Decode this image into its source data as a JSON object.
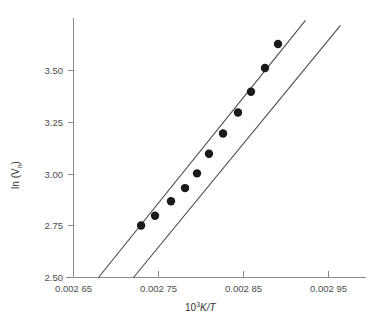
{
  "chart_data": {
    "type": "scatter",
    "title": "",
    "xlabel": "10³K/T",
    "ylabel": "ln (Vₙ)",
    "xlabel_parts": {
      "base": "10",
      "exponent": "3",
      "rest": "K/T"
    },
    "ylabel_parts": {
      "base": "ln (V",
      "subscript": "n",
      "close": ")"
    },
    "xlim": [
      0.00263,
      0.002965
    ],
    "ylim": [
      2.5,
      3.66
    ],
    "grid": false,
    "legend": null,
    "x_ticks": [
      0.00265,
      0.00275,
      0.00285,
      0.00295
    ],
    "x_tick_labels": [
      "0.002 65",
      "0.002 75",
      "0.002 85",
      "0.002 95"
    ],
    "y_ticks": [
      2.5,
      2.75,
      3.0,
      3.25,
      3.5
    ],
    "y_tick_labels": [
      "2.50",
      "2.75",
      "3.00",
      "3.25",
      "3.50"
    ],
    "points": [
      {
        "x": 0.0027295,
        "y": 2.751
      },
      {
        "x": 0.0027459,
        "y": 2.798
      },
      {
        "x": 0.0027647,
        "y": 2.868
      },
      {
        "x": 0.0027812,
        "y": 2.932
      },
      {
        "x": 0.0027953,
        "y": 3.003
      },
      {
        "x": 0.0028094,
        "y": 3.098
      },
      {
        "x": 0.0028259,
        "y": 3.196
      },
      {
        "x": 0.0028435,
        "y": 3.297
      },
      {
        "x": 0.0028588,
        "y": 3.397
      },
      {
        "x": 0.0028753,
        "y": 3.512
      },
      {
        "x": 0.0028906,
        "y": 3.628
      }
    ],
    "series": [
      {
        "name": "steep-fit-line",
        "type": "line",
        "x": [
          0.0026794,
          0.0029229
        ],
        "y": [
          2.5,
          3.742
        ]
      },
      {
        "name": "shallow-fit-line",
        "type": "line",
        "x": [
          0.0027206,
          0.0029641
        ],
        "y": [
          2.5,
          3.718
        ]
      }
    ]
  },
  "axes": {
    "x_axis_name": "x-axis",
    "y_axis_name": "y-axis"
  }
}
